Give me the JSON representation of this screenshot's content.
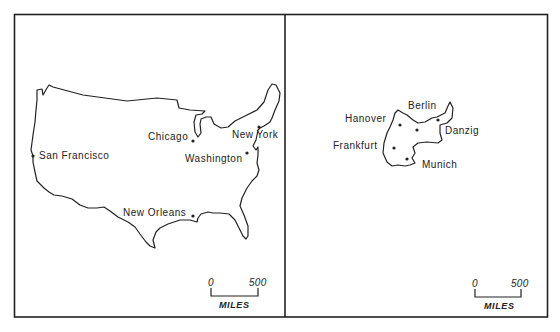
{
  "figure": {
    "panels": [
      {
        "id": "left",
        "cities": [
          {
            "label": "San Francisco"
          },
          {
            "label": "Chicago"
          },
          {
            "label": "New York"
          },
          {
            "label": "Washington"
          },
          {
            "label": "New Orleans"
          }
        ],
        "scale": {
          "start": "0",
          "end": "500",
          "unit": "MILES"
        }
      },
      {
        "id": "right",
        "cities": [
          {
            "label": "Hanover"
          },
          {
            "label": "Berlin"
          },
          {
            "label": "Danzig"
          },
          {
            "label": "Frankfurt"
          },
          {
            "label": "Munich"
          }
        ],
        "scale": {
          "start": "0",
          "end": "500",
          "unit": "MILES"
        }
      }
    ],
    "colors": {
      "ink": "#222222",
      "paper": "#ffffff"
    }
  }
}
